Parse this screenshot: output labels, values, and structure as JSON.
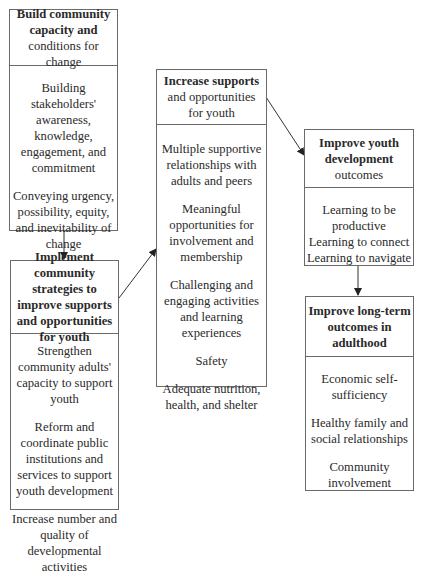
{
  "boxes": {
    "capacity": {
      "title_bold": "Build community capacity and",
      "title_rest": "conditions for change",
      "items": [
        "Building stakeholders' awareness, knowledge, engagement, and commitment",
        "Conveying urgency, possibility, equity, and inevitability of change"
      ]
    },
    "strategies": {
      "title_bold": "Implement community strategies to improve supports and opportunities for youth",
      "items": [
        "Strengthen community adults' capacity to support youth",
        "Reform and coordinate public institutions and services to support youth development",
        "Increase number and quality of developmental activities"
      ]
    },
    "supports": {
      "title_bold": "Increase supports",
      "title_rest": "and opportunities for youth",
      "items": [
        "Multiple supportive relationships with adults and peers",
        "Meaningful opportunities for involvement and membership",
        "Challenging and engaging activities and learning experiences",
        "Safety",
        "Adequate nutrition, health, and shelter"
      ]
    },
    "youth_outcomes": {
      "title_bold": "Improve youth development",
      "title_rest": "outcomes",
      "items": [
        "Learning to be productive",
        "Learning to connect",
        "Learning to navigate"
      ]
    },
    "adult_outcomes": {
      "title_bold": "Improve long-term outcomes in adulthood",
      "items": [
        "Economic self-sufficiency",
        "Healthy family and social relationships",
        "Community involvement"
      ]
    }
  },
  "arrows": [
    {
      "from": "capacity",
      "to": "strategies"
    },
    {
      "from": "strategies",
      "to": "supports"
    },
    {
      "from": "supports",
      "to": "youth_outcomes"
    },
    {
      "from": "youth_outcomes",
      "to": "adult_outcomes"
    }
  ],
  "colors": {
    "border": "#6a6a6a",
    "text": "#2a2a2a",
    "arrow": "#333333"
  }
}
